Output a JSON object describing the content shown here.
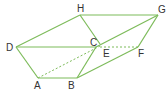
{
  "diagram": {
    "type": "geometric-solid",
    "line_color": "#7dbb5a",
    "label_color": "#333333",
    "vertices": {
      "A": "A",
      "B": "B",
      "C": "C",
      "D": "D",
      "E": "E",
      "F": "F",
      "G": "G",
      "H": "H"
    },
    "solid_edges": [
      "DH",
      "HG",
      "GF",
      "FB",
      "BA",
      "AD",
      "DC",
      "CB",
      "HC",
      "CG"
    ],
    "dashed_edges": [
      "AE",
      "EF"
    ]
  }
}
